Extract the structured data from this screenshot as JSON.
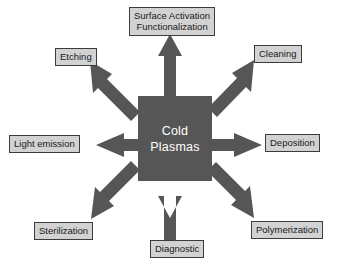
{
  "diagram": {
    "center": {
      "line1": "Cold",
      "line2": "Plasmas",
      "fill_color": "#565656",
      "text_color": "#ffffff"
    },
    "style": {
      "background_color": "#ffffff",
      "arrow_color": "#565656",
      "node_fill_color": "#d2d2d2",
      "node_border_color": "#3c3c3c",
      "node_text_color": "#1a1a1a"
    },
    "nodes": [
      {
        "id": "surface-activation",
        "line1": "Surface Activation",
        "line2": "Functionalization",
        "direction": "up"
      },
      {
        "id": "etching",
        "line1": "Etching",
        "line2": "",
        "direction": "up-left"
      },
      {
        "id": "cleaning",
        "line1": "Cleaning",
        "line2": "",
        "direction": "up-right"
      },
      {
        "id": "light-emission",
        "line1": "Light emission",
        "line2": "",
        "direction": "left"
      },
      {
        "id": "deposition",
        "line1": "Deposition",
        "line2": "",
        "direction": "right"
      },
      {
        "id": "sterilization",
        "line1": "Sterilization",
        "line2": "",
        "direction": "down-left"
      },
      {
        "id": "diagnostic",
        "line1": "Diagnostic",
        "line2": "",
        "direction": "down"
      },
      {
        "id": "polymerization",
        "line1": "Polymerization",
        "line2": "",
        "direction": "down-right"
      }
    ],
    "arrows": [
      {
        "id": "arrow-up",
        "points_to": "surface-activation"
      },
      {
        "id": "arrow-up-left",
        "points_to": "etching"
      },
      {
        "id": "arrow-up-right",
        "points_to": "cleaning"
      },
      {
        "id": "arrow-left",
        "points_to": "light-emission"
      },
      {
        "id": "arrow-right",
        "points_to": "deposition"
      },
      {
        "id": "arrow-down-left",
        "points_to": "sterilization"
      },
      {
        "id": "arrow-down",
        "points_to": "diagnostic"
      },
      {
        "id": "arrow-down-right",
        "points_to": "polymerization"
      }
    ]
  }
}
